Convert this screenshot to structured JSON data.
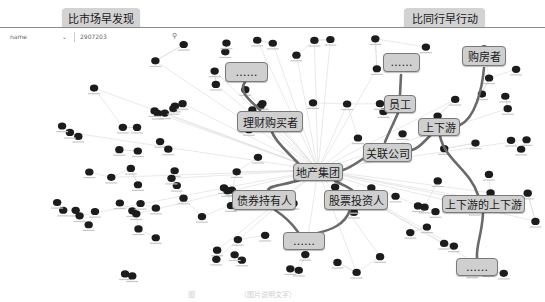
{
  "header": {
    "left_callout": "比市场早发现",
    "right_callout": "比同行早行动"
  },
  "search": {
    "field_select": "name",
    "dropdown_icon": "chevron-down-icon",
    "query_value": "2907203",
    "search_icon": "search-icon"
  },
  "callouts": {
    "ellipsis_1": "……",
    "wealth_buyers": "理财购买者",
    "ellipsis_2": "……",
    "home_buyers": "购房者",
    "employees": "员工",
    "supply_chain": "上下游",
    "affiliates": "关联公司",
    "center": "地产集团",
    "bond_holders": "债券持有人",
    "stock_investors": "股票投资人",
    "ellipsis_3": "……",
    "supply_chain_2nd": "上下游的上下游",
    "ellipsis_4": "……"
  },
  "caption": {
    "label": "图",
    "text": "（图片说明文字）"
  },
  "colors": {
    "node": "#1c1c1c",
    "edge": "#d8d8d8",
    "highlight_edge": "#6e6e6e",
    "callout_bg": "#cfcfcf"
  }
}
